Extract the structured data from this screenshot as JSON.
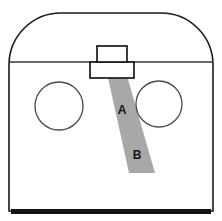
{
  "figure": {
    "background_color": "#ffffff",
    "width": 222,
    "height": 221
  },
  "colors": {
    "outline": "#1a1a1a",
    "thin_line": "#3a3a3a",
    "circle_line": "#4a4a4a",
    "band_fill": "#a8a8a8",
    "base_bar": "#141414",
    "label_text": "#141414",
    "body_fill": "#ffffff"
  },
  "body_outline": {
    "name": "enclosure-outline",
    "left_wall_x": 9,
    "right_wall_x": 213,
    "top_apex_y": 13,
    "shoulder_y": 62,
    "bottom_y": 211,
    "corner_radius": 52,
    "description": "Rounded-top enclosure profile: vertical side walls rising to arched shoulders and a flat crown."
  },
  "shoulder_line": {
    "name": "shoulder-divider-line",
    "y": 62,
    "x_start": 9,
    "x_end": 213,
    "description": "Horizontal divider separating the arched crown from the rectangular body."
  },
  "top_boxes": [
    {
      "name": "upper-tab-box",
      "x": 97,
      "y": 46,
      "width": 30,
      "height": 16,
      "description": "Small rectangular tab protruding above the shoulder line."
    },
    {
      "name": "lower-flange-box",
      "x": 90,
      "y": 62,
      "width": 44,
      "height": 16,
      "description": "Wider rectangular flange seated below the shoulder line."
    }
  ],
  "circles": [
    {
      "name": "left-circle",
      "label": "",
      "cx": 59,
      "cy": 106,
      "r": 24
    },
    {
      "name": "right-circle",
      "label": "",
      "cx": 159,
      "cy": 104,
      "r": 23
    }
  ],
  "band": {
    "name": "diagonal-band",
    "fill": "#a8a8a8",
    "top_left_x": 103,
    "top_right_x": 121,
    "top_y": 55,
    "bottom_left_x": 129,
    "bottom_right_x": 155,
    "bottom_y": 173,
    "description": "Shaded diagonal strip running from the top tab down and to the right."
  },
  "labels": [
    {
      "name": "band-label-a",
      "text": "A",
      "x": 122,
      "y": 110
    },
    {
      "name": "band-label-b",
      "text": "B",
      "x": 137,
      "y": 155
    }
  ],
  "base_bar": {
    "name": "base-bar",
    "x": 11,
    "y": 209,
    "width": 200,
    "height": 5,
    "fill": "#141414",
    "description": "Thick dark bar forming the base of the enclosure."
  }
}
